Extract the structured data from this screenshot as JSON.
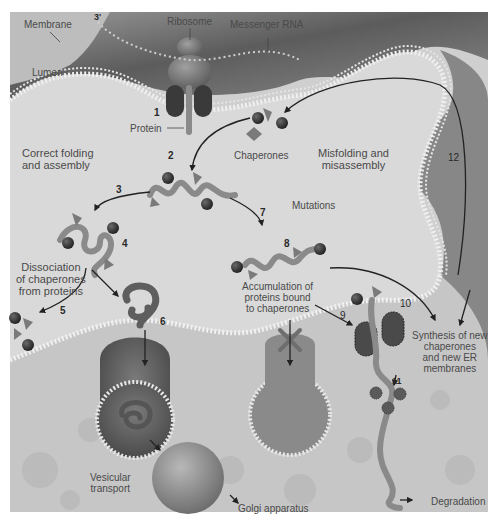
{
  "figure": {
    "palette": {
      "background": "#ffffff",
      "lumen": "#d4d4d4",
      "cytosol_dark": "#6a6a6a",
      "membrane_dots": "#ececec",
      "protein_chain": "#8a8a8a",
      "chaperone_sphere": "#3a3a3a",
      "chaperone_pyramid": "#7a7a7a",
      "arrow": "#222222",
      "text": "#4a4a4a"
    },
    "structure_labels": {
      "membrane": "Membrane",
      "ribosome": "Ribosome",
      "messenger_rna": "Messenger RNA",
      "lumen": "Lumen",
      "protein": "Protein",
      "chaperones": "Chaperones",
      "golgi": "Golgi apparatus"
    },
    "region_labels": {
      "correct_folding": "Correct folding\nand assembly",
      "misfolding": "Misfolding and\nmisassembly",
      "mutations": "Mutations",
      "dissociation": "Dissociation\nof chaperones\nfrom proteins",
      "accumulation": "Accumulation of\nproteins bound\nto chaperones",
      "synthesis": "Synthesis of new\nchaperones\nand new ER\nmembranes",
      "vesicular_transport": "Vesicular\ntransport",
      "degradation": "Degradation"
    },
    "steps": [
      "1",
      "2",
      "3",
      "4",
      "5",
      "6",
      "7",
      "8",
      "9",
      "10",
      "11",
      "12",
      "3'"
    ]
  }
}
